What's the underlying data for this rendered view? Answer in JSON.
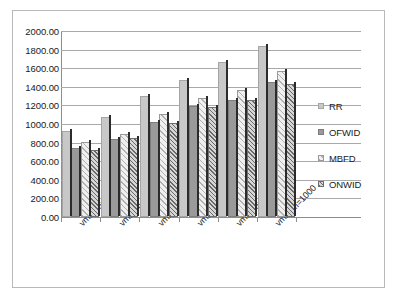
{
  "chart_data": {
    "type": "bar",
    "title": "",
    "subtitle": "",
    "xlabel": "",
    "ylabel": "",
    "ylim": [
      0,
      2000
    ],
    "ytick_step": 200,
    "ytick_labels": [
      "2000.00",
      "1800.00",
      "1600.00",
      "1400.00",
      "1200.00",
      "1000.00",
      "800.00",
      "600.00",
      "400.00",
      "200.00",
      "0.00"
    ],
    "grid": true,
    "legend_position": "right",
    "categories": [
      "vmnum=500",
      "vmnum=600",
      "vmnum=700",
      "vmnum=800",
      "vmnum=900",
      "vmnum=1000"
    ],
    "series": [
      {
        "name": "RR",
        "values": [
          930,
          1080,
          1305,
          1475,
          1665,
          1835
        ]
      },
      {
        "name": "OFWID",
        "values": [
          740,
          840,
          1025,
          1195,
          1260,
          1450
        ]
      },
      {
        "name": "MBFD",
        "values": [
          810,
          890,
          1105,
          1285,
          1370,
          1565
        ]
      },
      {
        "name": "ONWID",
        "values": [
          720,
          845,
          1015,
          1185,
          1255,
          1435
        ]
      }
    ],
    "series_colors": [
      "#c8c8c8",
      "#9a9a9a",
      "#efefef",
      "#d6d6d6"
    ]
  },
  "legend": {
    "items": [
      {
        "label": "RR"
      },
      {
        "label": "OFWID"
      },
      {
        "label": "MBFD"
      },
      {
        "label": "ONWID"
      }
    ]
  }
}
